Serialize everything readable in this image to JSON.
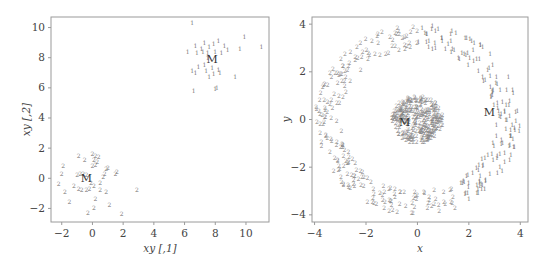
{
  "chart_data": [
    {
      "type": "scatter",
      "title": "",
      "xlabel": "xy [,1]",
      "ylabel": "xy [,2]",
      "xlim": [
        -2.7,
        11.5
      ],
      "ylim": [
        -2.9,
        10.7
      ],
      "xticks": [
        -2,
        0,
        2,
        4,
        6,
        8,
        10
      ],
      "yticks": [
        -2,
        0,
        2,
        4,
        6,
        8,
        10
      ],
      "grid": false,
      "legend": null,
      "marker": "cluster label text",
      "center_label": "M",
      "series": [
        {
          "name": "cluster 1",
          "label": "1",
          "center": [
            7.8,
            7.9
          ],
          "points": [
            [
              6.5,
              10.3
            ],
            [
              6.7,
              8.8
            ],
            [
              7.1,
              8.6
            ],
            [
              7.3,
              9.0
            ],
            [
              7.6,
              8.7
            ],
            [
              7.9,
              8.9
            ],
            [
              8.2,
              9.1
            ],
            [
              8.6,
              8.8
            ],
            [
              6.2,
              8.4
            ],
            [
              6.8,
              8.3
            ],
            [
              7.2,
              8.4
            ],
            [
              7.5,
              8.3
            ],
            [
              8.0,
              8.4
            ],
            [
              8.4,
              8.3
            ],
            [
              8.8,
              8.5
            ],
            [
              9.6,
              8.6
            ],
            [
              9.9,
              9.4
            ],
            [
              11.0,
              8.7
            ],
            [
              6.9,
              7.4
            ],
            [
              7.3,
              7.5
            ],
            [
              7.8,
              7.3
            ],
            [
              8.2,
              7.2
            ],
            [
              6.5,
              7.1
            ],
            [
              6.7,
              7.0
            ],
            [
              7.4,
              7.1
            ],
            [
              7.9,
              6.9
            ],
            [
              8.3,
              7.0
            ],
            [
              7.6,
              6.7
            ],
            [
              9.3,
              6.7
            ],
            [
              6.6,
              5.8
            ],
            [
              8.0,
              5.9
            ],
            [
              8.1,
              6.0
            ],
            [
              7.5,
              8.0
            ]
          ]
        },
        {
          "name": "cluster 2",
          "label": "2",
          "center": [
            -0.4,
            0.0
          ],
          "points": [
            [
              0.0,
              1.6
            ],
            [
              0.2,
              1.5
            ],
            [
              0.4,
              1.4
            ],
            [
              -0.9,
              1.5
            ],
            [
              -0.5,
              1.2
            ],
            [
              0.1,
              1.2
            ],
            [
              0.3,
              1.1
            ],
            [
              0.0,
              0.8
            ],
            [
              0.2,
              0.9
            ],
            [
              -1.9,
              0.8
            ],
            [
              0.9,
              0.6
            ],
            [
              1.0,
              0.7
            ],
            [
              -2.0,
              0.3
            ],
            [
              -1.0,
              0.2
            ],
            [
              -0.8,
              0.3
            ],
            [
              -0.6,
              0.3
            ],
            [
              -0.4,
              0.2
            ],
            [
              0.8,
              0.3
            ],
            [
              0.7,
              0.1
            ],
            [
              1.5,
              0.3
            ],
            [
              1.6,
              0.4
            ],
            [
              -2.2,
              -0.4
            ],
            [
              -1.2,
              -0.5
            ],
            [
              -0.9,
              -0.7
            ],
            [
              -0.7,
              -0.8
            ],
            [
              -0.4,
              -0.8
            ],
            [
              -0.2,
              -0.7
            ],
            [
              0.1,
              -0.5
            ],
            [
              0.5,
              -0.3
            ],
            [
              0.9,
              -0.9
            ],
            [
              -1.8,
              -0.9
            ],
            [
              0.5,
              -0.8
            ],
            [
              2.9,
              -0.8
            ],
            [
              -1.5,
              -1.6
            ],
            [
              0.2,
              -1.4
            ],
            [
              1.1,
              -1.8
            ],
            [
              0.1,
              -2.0
            ],
            [
              -0.3,
              -2.3
            ],
            [
              1.9,
              -2.4
            ],
            [
              -0.1,
              -0.3
            ]
          ]
        }
      ]
    },
    {
      "type": "scatter",
      "title": "",
      "xlabel": "x",
      "ylabel": "y",
      "xlim": [
        -4.1,
        4.3
      ],
      "ylim": [
        -4.3,
        4.3
      ],
      "xticks": [
        -4,
        -2,
        0,
        2,
        4
      ],
      "yticks": [
        -4,
        -2,
        0,
        2,
        4
      ],
      "grid": false,
      "legend": null,
      "marker": "cluster label text",
      "center_label": "M",
      "series": [
        {
          "name": "inner disk",
          "label": "2",
          "shape": "disk",
          "center_xy": [
            0,
            0
          ],
          "radius": 1.0,
          "n_points": 300,
          "center": [
            -0.5,
            -0.1
          ]
        },
        {
          "name": "outer ring (left part)",
          "label": "2",
          "shape": "ring",
          "inner_radius": 3.0,
          "outer_radius": 4.0,
          "angle_range_deg": [
            90,
            300
          ],
          "n_points": 220
        },
        {
          "name": "outer ring (right part)",
          "label": "1",
          "shape": "ring",
          "inner_radius": 3.0,
          "outer_radius": 4.0,
          "angle_range_deg": [
            -60,
            90
          ],
          "n_points": 160,
          "center": [
            2.8,
            0.3
          ]
        }
      ]
    }
  ]
}
